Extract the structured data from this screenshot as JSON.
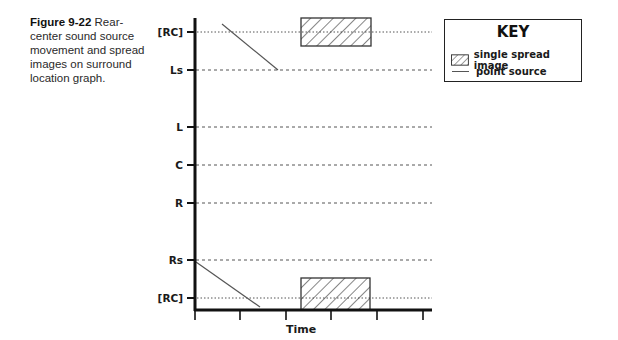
{
  "caption": {
    "figure_label": "Figure 9-22",
    "text": " Rear-center sound source movement and spread images on surround location graph."
  },
  "graph": {
    "y_labels": {
      "rc_top": "[RC]",
      "ls": "Ls",
      "l": "L",
      "c": "C",
      "r": "R",
      "rs": "Rs",
      "rc_bottom": "[RC]"
    },
    "x_label": "Time"
  },
  "key": {
    "title": "KEY",
    "items": [
      {
        "label": "single spread image",
        "icon": "hatched-box"
      },
      {
        "label": "point source",
        "icon": "thin-line"
      }
    ]
  },
  "colors": {
    "axis": "#111111",
    "gridline": "#555555",
    "point_source": "#555555",
    "hatch": "#333333"
  }
}
